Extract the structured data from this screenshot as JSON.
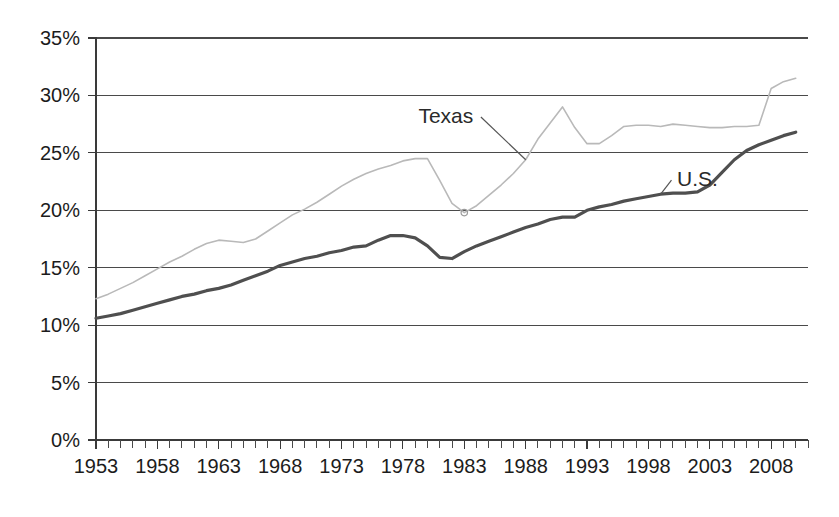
{
  "chart_data": {
    "type": "line",
    "title": "",
    "subtitle": "",
    "xlabel": "",
    "ylabel": "",
    "xlim": [
      1953,
      2011
    ],
    "ylim": [
      0,
      35
    ],
    "grid": true,
    "grid_axis": "y",
    "legend_position": "inline-annotation",
    "y_tick_labels": [
      "0%",
      "5%",
      "10%",
      "15%",
      "20%",
      "25%",
      "30%",
      "35%"
    ],
    "y_tick_values": [
      0,
      5,
      10,
      15,
      20,
      25,
      30,
      35
    ],
    "x_tick_labels": [
      "1953",
      "1958",
      "1963",
      "1968",
      "1973",
      "1978",
      "1983",
      "1988",
      "1993",
      "1998",
      "2003",
      "2008"
    ],
    "x_tick_values": [
      1953,
      1958,
      1963,
      1968,
      1973,
      1978,
      1983,
      1988,
      1993,
      1998,
      2003,
      2008
    ],
    "x_minor_ticks_every": 1,
    "annotations": [
      {
        "name": "texas-label",
        "text": "Texas",
        "x": 1981.5,
        "y": 27.6
      },
      {
        "name": "us-label",
        "text": "U.S.",
        "x": 2002.0,
        "y": 22.1
      }
    ],
    "series": [
      {
        "name": "Texas",
        "color": "#b9b9b9",
        "line_width": 1.6,
        "x": [
          1953,
          1954,
          1955,
          1956,
          1957,
          1958,
          1959,
          1960,
          1961,
          1962,
          1963,
          1964,
          1965,
          1966,
          1967,
          1968,
          1969,
          1970,
          1971,
          1972,
          1973,
          1974,
          1975,
          1976,
          1977,
          1978,
          1979,
          1980,
          1981,
          1982,
          1983,
          1984,
          1985,
          1986,
          1987,
          1988,
          1989,
          1990,
          1991,
          1992,
          1993,
          1994,
          1995,
          1996,
          1997,
          1998,
          1999,
          2000,
          2001,
          2002,
          2003,
          2004,
          2005,
          2006,
          2007,
          2008,
          2009,
          2010
        ],
        "values": [
          12.3,
          12.7,
          13.2,
          13.7,
          14.3,
          14.9,
          15.5,
          16.0,
          16.6,
          17.1,
          17.4,
          17.3,
          17.2,
          17.5,
          18.2,
          18.9,
          19.6,
          20.1,
          20.7,
          21.4,
          22.1,
          22.7,
          23.2,
          23.6,
          23.9,
          24.3,
          24.5,
          24.5,
          22.6,
          20.6,
          19.8,
          20.4,
          21.3,
          22.2,
          23.2,
          24.4,
          26.2,
          27.6,
          29.0,
          27.2,
          25.8,
          25.8,
          26.5,
          27.3,
          27.4,
          27.4,
          27.3,
          27.5,
          27.4,
          27.3,
          27.2,
          27.2,
          27.3,
          27.3,
          27.4,
          30.6,
          31.2,
          31.5
        ]
      },
      {
        "name": "U.S.",
        "color": "#4f4f4f",
        "line_width": 3.2,
        "x": [
          1953,
          1954,
          1955,
          1956,
          1957,
          1958,
          1959,
          1960,
          1961,
          1962,
          1963,
          1964,
          1965,
          1966,
          1967,
          1968,
          1969,
          1970,
          1971,
          1972,
          1973,
          1974,
          1975,
          1976,
          1977,
          1978,
          1979,
          1980,
          1981,
          1982,
          1983,
          1984,
          1985,
          1986,
          1987,
          1988,
          1989,
          1990,
          1991,
          1992,
          1993,
          1994,
          1995,
          1996,
          1997,
          1998,
          1999,
          2000,
          2001,
          2002,
          2003,
          2004,
          2005,
          2006,
          2007,
          2008,
          2009,
          2010
        ],
        "values": [
          10.6,
          10.8,
          11.0,
          11.3,
          11.6,
          11.9,
          12.2,
          12.5,
          12.7,
          13.0,
          13.2,
          13.5,
          13.9,
          14.3,
          14.7,
          15.2,
          15.5,
          15.8,
          16.0,
          16.3,
          16.5,
          16.8,
          16.9,
          17.4,
          17.8,
          17.8,
          17.6,
          16.9,
          15.9,
          15.8,
          16.4,
          16.9,
          17.3,
          17.7,
          18.1,
          18.5,
          18.8,
          19.2,
          19.4,
          19.4,
          20.0,
          20.3,
          20.5,
          20.8,
          21.0,
          21.2,
          21.4,
          21.5,
          21.5,
          21.6,
          22.2,
          23.3,
          24.4,
          25.2,
          25.7,
          26.1,
          26.5,
          26.8
        ]
      }
    ]
  },
  "plot_geometry": {
    "left": 96,
    "right": 808,
    "top": 38,
    "bottom": 440
  }
}
